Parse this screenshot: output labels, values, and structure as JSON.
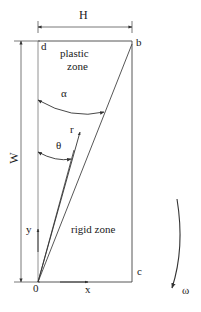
{
  "figure": {
    "labels": {
      "H": "H",
      "W": "W",
      "d": "d",
      "b": "b",
      "c": "c",
      "origin": "0",
      "x": "x",
      "y": "y",
      "r": "r",
      "alpha": "α",
      "theta": "θ",
      "omega": "ω",
      "plastic_zone_line1": "plastic",
      "plastic_zone_line2": "zone",
      "rigid_zone": "rigid zone"
    },
    "colors": {
      "line": "#333333",
      "dimension_line": "#555555",
      "text": "#1a1a1a",
      "background": "#ffffff"
    }
  }
}
